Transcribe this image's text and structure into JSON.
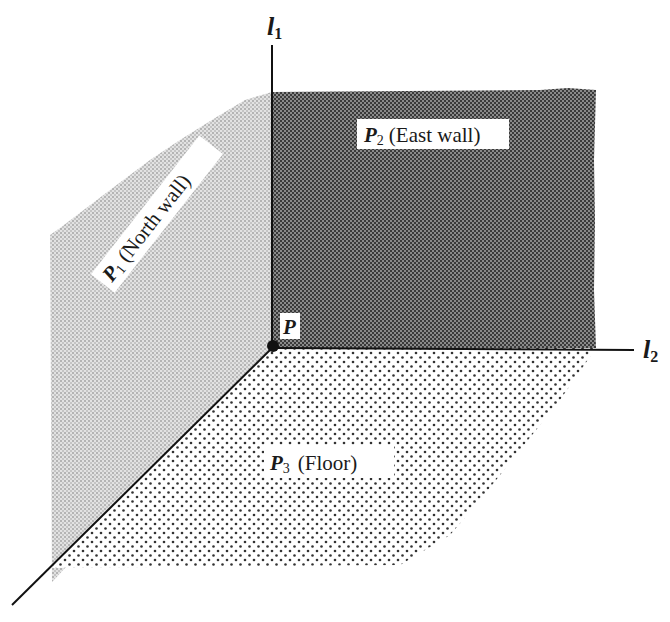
{
  "diagram": {
    "axes": {
      "l1": {
        "name": "l",
        "sub": "1"
      },
      "l2": {
        "name": "l",
        "sub": "2"
      }
    },
    "point": {
      "label": "P"
    },
    "planes": [
      {
        "id": "P1",
        "name": "P",
        "sub": "1",
        "desc": "(North wall)",
        "fill": "#c8c8c8"
      },
      {
        "id": "P2",
        "name": "P",
        "sub": "2",
        "desc": "(East wall)",
        "fill": "#5a5a5a"
      },
      {
        "id": "P3",
        "name": "P",
        "sub": "3",
        "desc": "(Floor)",
        "fill": "#ffffff"
      }
    ],
    "colors": {
      "line": "#111111",
      "north_wall": "#c8c8c8",
      "east_wall": "#5a5a5a",
      "floor_dot": "#333333"
    }
  }
}
